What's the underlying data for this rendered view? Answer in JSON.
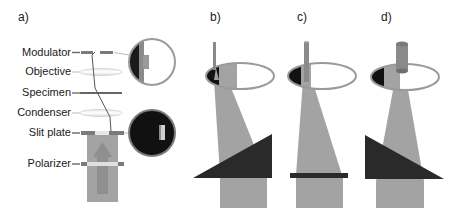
{
  "panels": {
    "a": "a)",
    "b": "b)",
    "c": "c)",
    "d": "d)"
  },
  "components": [
    {
      "label": "Modulator"
    },
    {
      "label": "Objective"
    },
    {
      "label": "Specimen"
    },
    {
      "label": "Condenser"
    },
    {
      "label": "Slit plate"
    },
    {
      "label": "Polarizer"
    }
  ],
  "colors": {
    "dark": "#222222",
    "beam_gray": "#a3a3a3",
    "mid_gray": "#8a8a8a",
    "light_gray": "#d0d0d0",
    "white": "#ffffff",
    "outline": "#9a9a9a"
  }
}
